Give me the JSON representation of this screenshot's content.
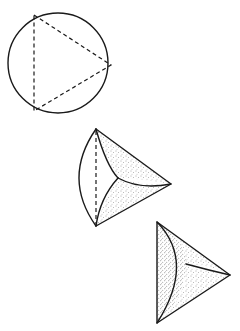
{
  "figure": {
    "colors": {
      "ink": "#1a1a1a",
      "background": "#ffffff",
      "stipple": "#555555"
    },
    "stages": [
      {
        "id": "stage-1",
        "label": "circle with inscribed dashed triangle"
      },
      {
        "id": "stage-2",
        "label": "partially folded circle"
      },
      {
        "id": "stage-3",
        "label": "fully folded triangle"
      }
    ]
  }
}
